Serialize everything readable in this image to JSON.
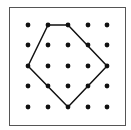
{
  "diagram": {
    "type": "geoboard-polygon",
    "grid": {
      "rows": 5,
      "cols": 5,
      "x_positions": [
        28,
        48,
        68,
        88,
        107
      ],
      "y_positions": [
        25,
        45,
        66,
        86,
        107
      ],
      "dot_radius": 2.4,
      "dot_color": "#111111"
    },
    "frame": {
      "x": 9.5,
      "y": 7.5,
      "width": 116,
      "height": 118,
      "stroke": "#555555",
      "fill": "#ffffff"
    },
    "polygon": {
      "vertices_grid": [
        [
          1,
          0
        ],
        [
          2,
          0
        ],
        [
          4,
          2
        ],
        [
          2,
          4
        ],
        [
          0,
          2
        ]
      ],
      "stroke": "#111111",
      "stroke_width": 1.5,
      "sides": 5
    }
  }
}
